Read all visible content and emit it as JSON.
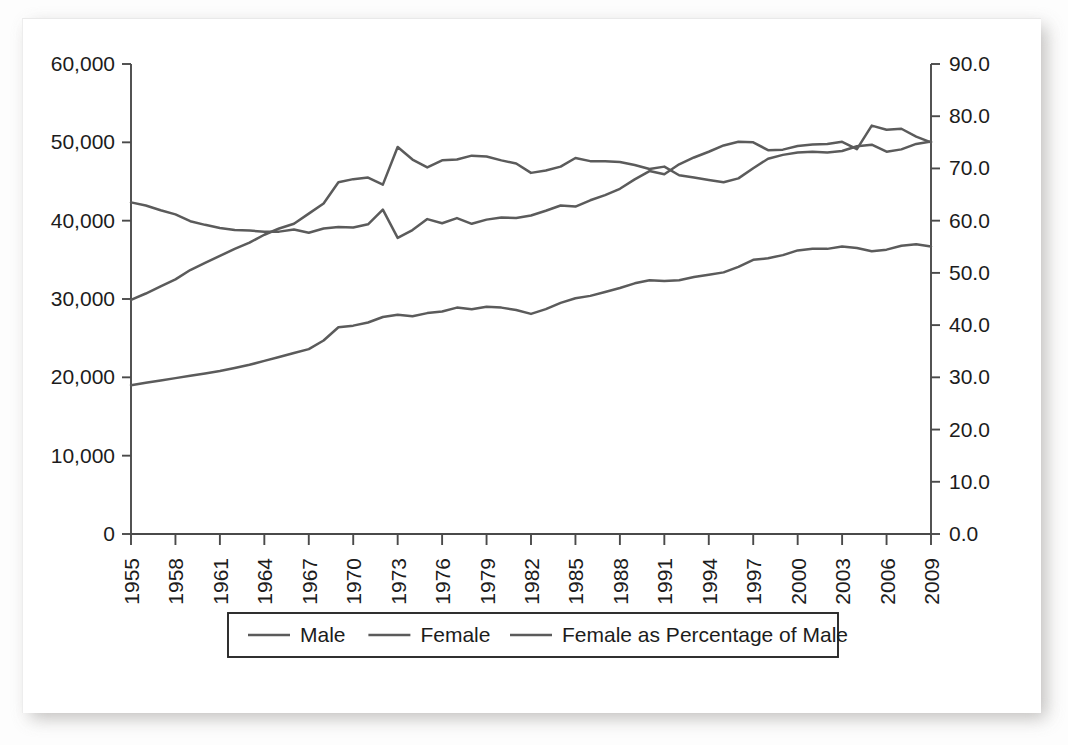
{
  "figure": {
    "background": "#ffffff",
    "line_color": "#5b5b5b",
    "axis_color": "#4a4a4a",
    "text_color": "#1c1c1c"
  },
  "legend": {
    "items": [
      {
        "label": "Male",
        "color": "#5b5b5b"
      },
      {
        "label": "Female",
        "color": "#5b5b5b"
      },
      {
        "label": "Female as Percentage of Male",
        "color": "#5b5b5b"
      }
    ]
  },
  "axes": {
    "left": {
      "ticks": [
        "0",
        "10,000",
        "20,000",
        "30,000",
        "40,000",
        "50,000",
        "60,000"
      ],
      "min": 0,
      "max": 60000,
      "step": 10000
    },
    "right": {
      "ticks": [
        "0.0",
        "10.0",
        "20.0",
        "30.0",
        "40.0",
        "50.0",
        "60.0",
        "70.0",
        "80.0",
        "90.0"
      ],
      "min": 0,
      "max": 90,
      "step": 10
    },
    "bottom": {
      "ticks": [
        "1955",
        "1958",
        "1961",
        "1964",
        "1967",
        "1970",
        "1973",
        "1976",
        "1979",
        "1982",
        "1985",
        "1988",
        "1991",
        "1994",
        "1997",
        "2000",
        "2003",
        "2006",
        "2009"
      ],
      "rotation": -90
    }
  },
  "chart_data": {
    "type": "line",
    "title": "",
    "xlabel": "",
    "ylabel": "",
    "y2label": "",
    "grid": false,
    "legend_position": "bottom",
    "xlim": [
      1955,
      2009
    ],
    "ylim": [
      0,
      60000
    ],
    "y2lim": [
      0,
      90
    ],
    "x": [
      1955,
      1956,
      1957,
      1958,
      1959,
      1960,
      1961,
      1962,
      1963,
      1964,
      1965,
      1966,
      1967,
      1968,
      1969,
      1970,
      1971,
      1972,
      1973,
      1974,
      1975,
      1976,
      1977,
      1978,
      1979,
      1980,
      1981,
      1982,
      1983,
      1984,
      1985,
      1986,
      1987,
      1988,
      1989,
      1990,
      1991,
      1992,
      1993,
      1994,
      1995,
      1996,
      1997,
      1998,
      1999,
      2000,
      2001,
      2002,
      2003,
      2004,
      2005,
      2006,
      2007,
      2008,
      2009
    ],
    "series": [
      {
        "name": "Male",
        "axis": "left",
        "unit": "count",
        "color": "#5b5b5b",
        "values": [
          29900,
          30700,
          31600,
          32500,
          33700,
          34600,
          35500,
          36400,
          37200,
          38200,
          39000,
          39600,
          40900,
          42200,
          44900,
          45300,
          45500,
          44600,
          49400,
          47800,
          46800,
          47700,
          47800,
          48300,
          48200,
          47700,
          47300,
          46100,
          46400,
          46900,
          48000,
          47600,
          47600,
          47500,
          47100,
          46600,
          46900,
          45800,
          45500,
          45200,
          44900,
          45400,
          46700,
          47900,
          48400,
          48700,
          48800,
          48700,
          48900,
          49500,
          49700,
          48800,
          49100,
          49800,
          50100
        ]
      },
      {
        "name": "Female",
        "axis": "left",
        "unit": "count",
        "color": "#5b5b5b",
        "values": [
          19000,
          19300,
          19600,
          19900,
          20200,
          20500,
          20800,
          21200,
          21600,
          22100,
          22600,
          23100,
          23600,
          24700,
          26400,
          26600,
          27000,
          27700,
          28000,
          27800,
          28200,
          28400,
          28900,
          28700,
          29000,
          28900,
          28600,
          28100,
          28700,
          29500,
          30100,
          30400,
          30900,
          31400,
          32000,
          32400,
          32300,
          32400,
          32800,
          33100,
          33400,
          34100,
          35000,
          35200,
          35600,
          36200,
          36400,
          36400,
          36700,
          36500,
          36100,
          36300,
          36800,
          37000,
          36700
        ]
      },
      {
        "name": "Female as Percentage of Male",
        "axis": "right",
        "unit": "percent",
        "color": "#5b5b5b",
        "values": [
          63.5,
          62.9,
          62.0,
          61.2,
          59.9,
          59.2,
          58.6,
          58.2,
          58.1,
          57.9,
          57.9,
          58.3,
          57.7,
          58.5,
          58.8,
          58.7,
          59.3,
          62.1,
          56.7,
          58.2,
          60.3,
          59.5,
          60.5,
          59.4,
          60.2,
          60.6,
          60.5,
          61.0,
          61.9,
          62.9,
          62.7,
          63.9,
          64.9,
          66.1,
          67.9,
          69.5,
          68.9,
          70.8,
          72.1,
          73.2,
          74.4,
          75.1,
          75.0,
          73.5,
          73.6,
          74.3,
          74.6,
          74.7,
          75.1,
          73.7,
          78.2,
          77.4,
          77.6,
          76.1,
          75.0
        ]
      }
    ]
  }
}
